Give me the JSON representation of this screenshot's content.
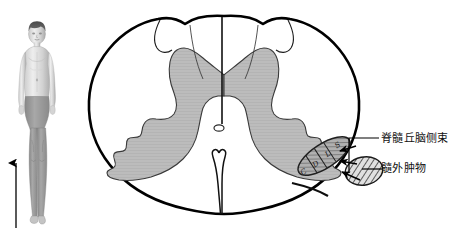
{
  "patient_figure": {
    "name": "child-standing-frontal",
    "shaded_region": "lower-body",
    "arrow": {
      "name": "ascending-sensory-level-arrow",
      "direction": "up"
    }
  },
  "cord": {
    "name": "spinal-cord-cross-section",
    "gray_matter_name": "gray-matter-butterfly",
    "central_canal_name": "central-canal",
    "posterior_median_sulcus_name": "posterior-median-sulcus",
    "anterior_median_fissure_name": "anterior-median-fissure"
  },
  "tract": {
    "name": "lateral-spinothalamic-tract",
    "lamination": [
      "S",
      "L",
      "D",
      "C"
    ],
    "lamination_meaning": {
      "S": "sacral",
      "L": "lumbar",
      "D": "thoracic",
      "C": "cervical"
    }
  },
  "mass": {
    "name": "extramedullary-mass",
    "pattern": "diagonal-hatch"
  },
  "labels": {
    "tract": "脊髓丘脑侧束",
    "mass": "髓外肿物"
  },
  "colors": {
    "outline": "#000000",
    "gray_matter": "#b9b9b9",
    "gray_matter_stroke": "#2b2b2b",
    "tract_fill": "#a8a8a8",
    "mass_fill": "#d8d8d8",
    "hatch": "#3a3a3a",
    "body_shade": "#9a9a9a",
    "label_text": "#111111",
    "background": "#ffffff"
  }
}
